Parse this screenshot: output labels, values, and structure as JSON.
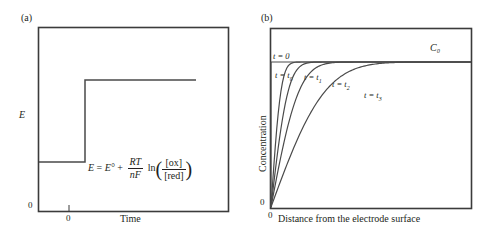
{
  "figure": {
    "panels": [
      {
        "tag": "(a)",
        "axes": {
          "y_label": "E",
          "x_label": "Time",
          "y_origin_tick": "0",
          "x_origin_tick": "0"
        },
        "equation": {
          "lhs": "E",
          "equals": "=",
          "e_standard": "E°",
          "plus": "+",
          "prefactor_num": "RT",
          "prefactor_den": "nF",
          "ln": "ln",
          "ratio_num": "[ox]",
          "ratio_den": "[red]",
          "plain": "E = E° + (RT/nF) ln([ox]/[red])"
        },
        "signal": {
          "description": "potential step",
          "baseline_level": 0.28,
          "step_level": 0.78,
          "step_time": 0.28
        }
      },
      {
        "tag": "(b)",
        "axes": {
          "y_label": "Concentration",
          "x_label": "Distance from the electrode surface",
          "y_origin_tick": "0",
          "x_origin_tick": "0"
        },
        "bulk_label": "C₀",
        "curves": [
          {
            "label": "t = 0",
            "sublabel": "",
            "k": 0.0
          },
          {
            "label": "t = t",
            "sublabel": "0",
            "k": 0.055
          },
          {
            "label": "t = t",
            "sublabel": "1",
            "k": 0.095
          },
          {
            "label": "t = t",
            "sublabel": "2",
            "k": 0.155
          },
          {
            "label": "t = t",
            "sublabel": "3",
            "k": 0.3
          }
        ]
      }
    ]
  },
  "chart_data": {
    "type": "line",
    "title": "",
    "panels": [
      {
        "id": "a",
        "type": "line",
        "title": "(a)",
        "xlabel": "Time",
        "ylabel": "E",
        "xlim": [
          0,
          1
        ],
        "ylim": [
          0,
          1
        ],
        "grid": false,
        "xticks": [
          "0"
        ],
        "yticks": [
          "0"
        ],
        "annotations": [
          "E = E° + (RT/nF) ln([ox]/[red])"
        ],
        "series": [
          {
            "name": "potential step",
            "x": [
              0.0,
              0.28,
              0.28,
              0.82
            ],
            "y": [
              0.28,
              0.28,
              0.78,
              0.78
            ]
          }
        ]
      },
      {
        "id": "b",
        "type": "line",
        "title": "(b)",
        "xlabel": "Distance from the electrode surface",
        "ylabel": "Concentration",
        "xlim": [
          0,
          1
        ],
        "ylim": [
          0,
          1
        ],
        "grid": false,
        "xticks": [
          "0"
        ],
        "yticks": [
          "0"
        ],
        "annotations": [
          "C₀",
          "t = 0",
          "t = t0",
          "t = t1",
          "t = t2",
          "t = t3"
        ],
        "series": [
          {
            "name": "t = 0",
            "model": "bulk concentration C0, flat at y = 0.88 for x > 0, drops to 0 at electrode"
          },
          {
            "name": "t = t0",
            "model": "erf(x / 0.055)",
            "diffusion_layer": 0.055
          },
          {
            "name": "t = t1",
            "model": "erf(x / 0.095)",
            "diffusion_layer": 0.095
          },
          {
            "name": "t = t2",
            "model": "erf(x / 0.155)",
            "diffusion_layer": 0.155
          },
          {
            "name": "t = t3",
            "model": "erf(x / 0.30)",
            "diffusion_layer": 0.3
          }
        ]
      }
    ]
  }
}
